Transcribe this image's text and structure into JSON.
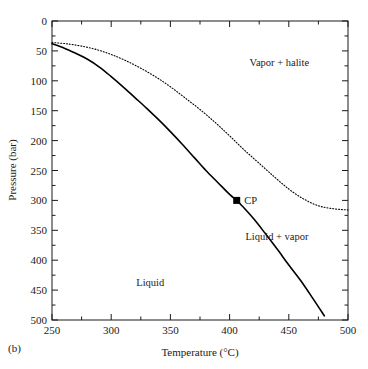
{
  "panel": {
    "label": "(b)"
  },
  "chart_data": {
    "type": "line",
    "title": "",
    "subtitle": "",
    "xlabel": "Temperature (°C)",
    "ylabel": "Pressure (bar)",
    "xlim": [
      250,
      500
    ],
    "ylim": [
      0,
      500
    ],
    "y_inverted": true,
    "grid": false,
    "legend": null,
    "xticks": [
      250,
      300,
      350,
      400,
      450,
      500
    ],
    "xtick_labels": [
      "250",
      "300",
      "350",
      "400",
      "450",
      "500"
    ],
    "x_minor_ticks": [
      275,
      325,
      375,
      425,
      475
    ],
    "yticks": [
      0,
      50,
      100,
      150,
      200,
      250,
      300,
      350,
      400,
      450,
      500
    ],
    "ytick_labels": [
      "0",
      "50",
      "100",
      "150",
      "200",
      "250",
      "300",
      "350",
      "400",
      "450",
      "500"
    ],
    "y_minor_ticks": [
      25,
      75,
      125,
      175,
      225,
      275,
      325,
      375,
      425,
      475
    ],
    "series": [
      {
        "name": "Liquid-vapor boundary",
        "style": "solid",
        "color": "#000000",
        "width": 1.6,
        "points": [
          [
            250,
            38
          ],
          [
            260,
            45
          ],
          [
            270,
            54
          ],
          [
            280,
            64
          ],
          [
            290,
            77
          ],
          [
            300,
            93
          ],
          [
            310,
            110
          ],
          [
            320,
            128
          ],
          [
            330,
            146
          ],
          [
            340,
            165
          ],
          [
            350,
            185
          ],
          [
            360,
            206
          ],
          [
            370,
            228
          ],
          [
            380,
            250
          ],
          [
            390,
            270
          ],
          [
            400,
            290
          ],
          [
            406,
            300
          ],
          [
            410,
            308
          ],
          [
            420,
            330
          ],
          [
            430,
            355
          ],
          [
            440,
            381
          ],
          [
            450,
            408
          ],
          [
            460,
            434
          ],
          [
            470,
            463
          ],
          [
            480,
            493
          ]
        ]
      },
      {
        "name": "Vapor-halite boundary",
        "style": "dotted",
        "color": "#000000",
        "width": 1.1,
        "points": [
          [
            250,
            36
          ],
          [
            262,
            38
          ],
          [
            275,
            42
          ],
          [
            288,
            48
          ],
          [
            300,
            56
          ],
          [
            312,
            66
          ],
          [
            325,
            79
          ],
          [
            338,
            94
          ],
          [
            350,
            110
          ],
          [
            362,
            128
          ],
          [
            375,
            148
          ],
          [
            388,
            170
          ],
          [
            400,
            192
          ],
          [
            412,
            215
          ],
          [
            425,
            238
          ],
          [
            438,
            261
          ],
          [
            450,
            281
          ],
          [
            462,
            297
          ],
          [
            475,
            309
          ],
          [
            488,
            314
          ],
          [
            500,
            316
          ]
        ]
      }
    ],
    "markers": [
      {
        "name": "critical-point",
        "label": "CP",
        "x": 406,
        "y": 300,
        "shape": "square",
        "color": "#000000",
        "size": 7
      }
    ],
    "annotations": [
      {
        "name": "vapor-halite-region",
        "text": "Vapor + halite",
        "x": 442,
        "y": 70
      },
      {
        "name": "liquid-vapor-region",
        "text": "Liquid + vapor",
        "x": 440,
        "y": 360
      },
      {
        "name": "liquid-region",
        "text": "Liquid",
        "x": 333,
        "y": 437
      }
    ]
  }
}
